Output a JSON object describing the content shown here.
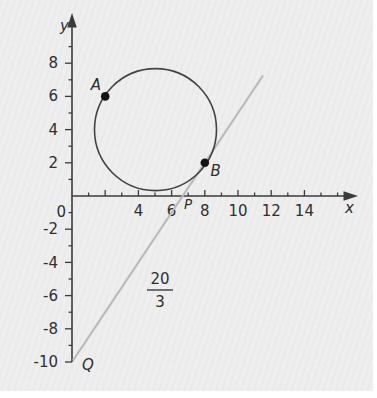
{
  "figure": {
    "y_axis_letter": "y",
    "x_axis_letter": "x",
    "origin_label": "0",
    "x_tick_labels": [
      "4",
      "6",
      "8",
      "10",
      "12",
      "14"
    ],
    "y_tick_labels": [
      "8",
      "6",
      "4",
      "2",
      "-2",
      "-4",
      "-6",
      "-8",
      "-10"
    ],
    "point_a_label": "A",
    "point_b_label": "B",
    "p_label": "P",
    "q_label": "Q",
    "fraction_numerator": "20",
    "fraction_denominator": "3",
    "colors": {
      "axis": "#3b3b3b",
      "circle": "#424242",
      "line": "#b9b9b9",
      "point": "#141414",
      "background": "#ebebeb"
    }
  },
  "chart_data": {
    "type": "scatter",
    "title": "",
    "xlabel": "x",
    "ylabel": "y",
    "xlim": [
      0,
      16.5
    ],
    "ylim": [
      -10.5,
      9.5
    ],
    "grid": false,
    "x_tick_labels": [
      4,
      6,
      8,
      10,
      12,
      14
    ],
    "y_tick_labels": [
      8,
      6,
      4,
      2,
      0,
      -2,
      -4,
      -6,
      -8,
      -10
    ],
    "points": [
      {
        "label": "A",
        "x": 2,
        "y": 6
      },
      {
        "label": "B",
        "x": 8,
        "y": 2
      },
      {
        "label": "P",
        "x": 6.667,
        "y": 0
      },
      {
        "label": "Q",
        "x": 0,
        "y": -10
      }
    ],
    "circle": {
      "center_x": 5,
      "center_y": 4,
      "radius": 3.606,
      "passes_through": [
        "A",
        "B"
      ]
    },
    "line": {
      "slope": 1.5,
      "y_intercept": -10,
      "x_intercept": 6.667,
      "x_intercept_annotation": "20/3",
      "tangent_to_circle_at": "B",
      "endpoints_drawn": [
        [
          0.05,
          -9.9
        ],
        [
          11.5,
          7.25
        ]
      ]
    },
    "annotations": [
      {
        "text": "20/3",
        "x": 5.3,
        "y": -5.6,
        "style": "fraction"
      }
    ]
  }
}
